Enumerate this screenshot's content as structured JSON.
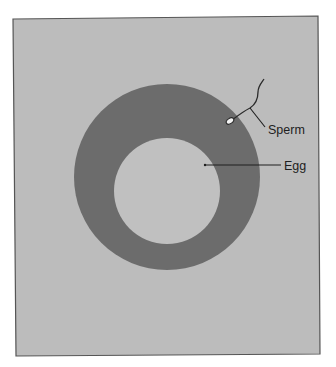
{
  "figure": {
    "type": "diagram",
    "colors": {
      "page": "#ffffff",
      "panel": "#bcbcbc",
      "panel_border": "#555555",
      "ring": "#6c6c6c",
      "inner": "#c0c0c0",
      "line": "#1e1e1e",
      "sperm_head": "#f2f2f2"
    },
    "labels": {
      "sperm": "Sperm",
      "egg": "Egg"
    }
  }
}
